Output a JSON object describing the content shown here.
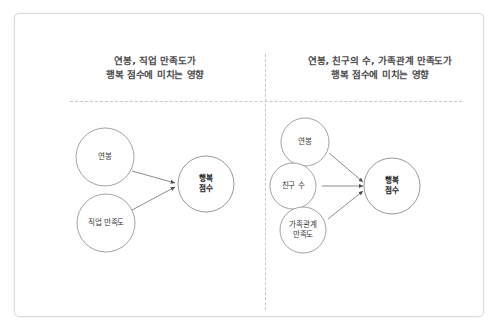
{
  "slide": {
    "background_color": "#ffffff",
    "frame_border_color": "#dcdcdc",
    "divider_color": "#c8c8c8",
    "node_stroke_color": "#8c8c8c",
    "edge_color": "#6e6e6e"
  },
  "panels": {
    "left": {
      "title": "연봉, 직업 만족도가\n행복 점수에 미치는 영향",
      "predictors": [
        {
          "label": "연봉"
        },
        {
          "label": "직업 만족도"
        }
      ],
      "outcome": {
        "label": "행복\n점수"
      }
    },
    "right": {
      "title": "연봉, 친구의 수, 가족관계 만족도가\n행복 점수에 미치는 영향",
      "predictors": [
        {
          "label": "연봉"
        },
        {
          "label": "친구 수"
        },
        {
          "label": "가족관계\n만족도"
        }
      ],
      "outcome": {
        "label": "행복\n점수"
      }
    }
  }
}
